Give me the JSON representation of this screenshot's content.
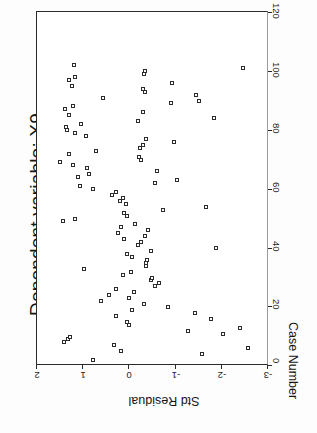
{
  "chart": {
    "title": "Dependent variable: X9",
    "rotation_note": "page rendered rotated 90 degrees counter-clockwise"
  },
  "axes": {
    "vertical_axis_title": "Std Residual",
    "vertical_ticks": [
      "2",
      "1",
      "0",
      "-1",
      "-2",
      "-3"
    ],
    "horizontal_axis_title": "Case Number",
    "horizontal_ticks": [
      "0",
      "20",
      "40",
      "60",
      "80",
      "100",
      "120"
    ]
  },
  "chart_data": {
    "type": "scatter",
    "title": "Dependent variable: X9",
    "xlabel": "Case Number",
    "ylabel": "Std Residual",
    "xlim": [
      0,
      120
    ],
    "ylim": [
      -3,
      2
    ],
    "grid": false,
    "legend": null,
    "marker": "open-square",
    "marker_color": "#2b2b2b",
    "points": [
      [
        2,
        0.8
      ],
      [
        4,
        -1.55
      ],
      [
        5,
        0.18
      ],
      [
        6,
        -2.55
      ],
      [
        7,
        0.35
      ],
      [
        8,
        1.42
      ],
      [
        9,
        1.34
      ],
      [
        10,
        1.28
      ],
      [
        11,
        -2.0
      ],
      [
        12,
        -1.25
      ],
      [
        13,
        -2.38
      ],
      [
        14,
        0.02
      ],
      [
        15,
        0.05
      ],
      [
        16,
        -1.75
      ],
      [
        17,
        0.3
      ],
      [
        18,
        -1.4
      ],
      [
        19,
        -0.05
      ],
      [
        20,
        -0.82
      ],
      [
        21,
        -0.3
      ],
      [
        22,
        0.62
      ],
      [
        23,
        0.02
      ],
      [
        24,
        0.45
      ],
      [
        25,
        -0.1
      ],
      [
        26,
        0.3
      ],
      [
        27,
        -0.55
      ],
      [
        28,
        -0.62
      ],
      [
        29,
        -0.45
      ],
      [
        30,
        -0.48
      ],
      [
        31,
        0.15
      ],
      [
        32,
        -0.02
      ],
      [
        33,
        0.98
      ],
      [
        34,
        -0.35
      ],
      [
        35,
        -0.35
      ],
      [
        36,
        -0.38
      ],
      [
        37,
        -0.05
      ],
      [
        38,
        0.05
      ],
      [
        39,
        -0.45
      ],
      [
        40,
        -1.85
      ],
      [
        41,
        -0.18
      ],
      [
        42,
        -0.25
      ],
      [
        43,
        0.12
      ],
      [
        44,
        -0.32
      ],
      [
        45,
        0.25
      ],
      [
        46,
        -0.4
      ],
      [
        47,
        0.2
      ],
      [
        48,
        -0.12
      ],
      [
        49,
        1.45
      ],
      [
        50,
        1.18
      ],
      [
        51,
        0.05
      ],
      [
        52,
        0.12
      ],
      [
        53,
        -0.72
      ],
      [
        54,
        -1.65
      ],
      [
        55,
        0.08
      ],
      [
        56,
        0.22
      ],
      [
        57,
        0.15
      ],
      [
        58,
        0.38
      ],
      [
        59,
        0.3
      ],
      [
        60,
        0.8
      ],
      [
        61,
        1.08
      ],
      [
        62,
        -0.55
      ],
      [
        63,
        -1.02
      ],
      [
        64,
        1.12
      ],
      [
        65,
        0.88
      ],
      [
        66,
        -0.58
      ],
      [
        67,
        0.92
      ],
      [
        68,
        1.22
      ],
      [
        69,
        1.5
      ],
      [
        70,
        -0.25
      ],
      [
        71,
        -0.2
      ],
      [
        72,
        1.3
      ],
      [
        73,
        0.72
      ],
      [
        74,
        -0.22
      ],
      [
        75,
        -0.28
      ],
      [
        76,
        -0.95
      ],
      [
        77,
        -0.35
      ],
      [
        78,
        0.95
      ],
      [
        79,
        1.18
      ],
      [
        80,
        1.35
      ],
      [
        81,
        1.38
      ],
      [
        82,
        1.05
      ],
      [
        83,
        -0.18
      ],
      [
        84,
        -1.82
      ],
      [
        85,
        1.3
      ],
      [
        86,
        -0.28
      ],
      [
        87,
        1.4
      ],
      [
        88,
        1.22
      ],
      [
        89,
        -0.88
      ],
      [
        90,
        -1.5
      ],
      [
        91,
        0.58
      ],
      [
        92,
        -1.42
      ],
      [
        93,
        -0.32
      ],
      [
        94,
        -0.28
      ],
      [
        95,
        1.25
      ],
      [
        96,
        -0.92
      ],
      [
        97,
        1.32
      ],
      [
        98,
        1.18
      ],
      [
        99,
        -0.3
      ],
      [
        100,
        -0.32
      ],
      [
        101,
        -2.45
      ],
      [
        102,
        1.2
      ]
    ]
  }
}
